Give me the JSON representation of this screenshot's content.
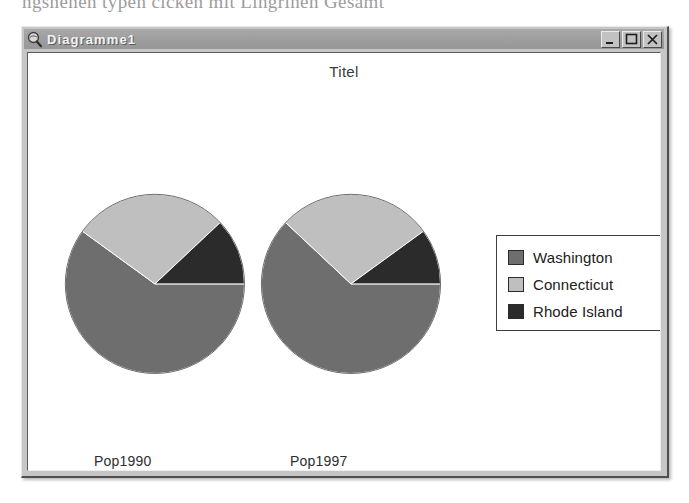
{
  "page_bleed_text": "ngsnenen  typen cicken mit Lingrinen  Gesamt",
  "window": {
    "title": "Diagramme1",
    "icon": "magnifier-icon",
    "controls": [
      {
        "name": "minimize-button",
        "glyph": "minimize-icon",
        "label": "Minimieren"
      },
      {
        "name": "maximize-button",
        "glyph": "maximize-icon",
        "label": "Maximieren"
      },
      {
        "name": "close-button",
        "glyph": "close-icon",
        "label": "Schließen"
      }
    ]
  },
  "chart_data": {
    "type": "pie",
    "title": "Titel",
    "xlabel": "",
    "ylabel": "",
    "grid": false,
    "legend_position": "right",
    "categories": [
      "Pop1990",
      "Pop1997"
    ],
    "legend": [
      "Washington",
      "Connecticut",
      "Rhode Island"
    ],
    "colors": [
      "#6e6e6e",
      "#bfbfbf",
      "#2b2b2b"
    ],
    "pies": [
      {
        "label": "Pop1990",
        "slices": [
          {
            "name": "Washington",
            "value": 60,
            "color": "#6e6e6e"
          },
          {
            "name": "Connecticut",
            "value": 28,
            "color": "#bfbfbf"
          },
          {
            "name": "Rhode Island",
            "value": 12,
            "color": "#2b2b2b"
          }
        ]
      },
      {
        "label": "Pop1997",
        "slices": [
          {
            "name": "Washington",
            "value": 62,
            "color": "#6e6e6e"
          },
          {
            "name": "Connecticut",
            "value": 28,
            "color": "#bfbfbf"
          },
          {
            "name": "Rhode Island",
            "value": 10,
            "color": "#2b2b2b"
          }
        ]
      }
    ],
    "series": [
      {
        "name": "Washington",
        "values": [
          60,
          62
        ]
      },
      {
        "name": "Connecticut",
        "values": [
          28,
          28
        ]
      },
      {
        "name": "Rhode Island",
        "values": [
          12,
          10
        ]
      }
    ]
  }
}
